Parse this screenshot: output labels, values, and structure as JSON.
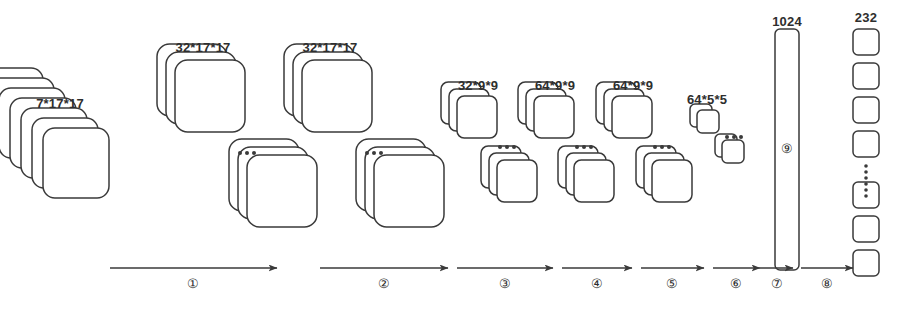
{
  "figure": {
    "type": "neural-network-architecture-diagram",
    "title": "",
    "background_color": "#ffffff",
    "stroke_color": "#3a3a3a",
    "text_color": "#2e2e2e"
  },
  "layers": [
    {
      "id": "input",
      "label": "7*17*17",
      "label_x": 60,
      "label_y": 96,
      "kind": "single-deep-stack",
      "card_w": 66,
      "card_h": 70,
      "count": 7,
      "dx": 11,
      "dy": 10,
      "x": 43,
      "y": 128
    },
    {
      "id": "conv1",
      "label": "32*17*17",
      "label_x": 203,
      "label_y": 40,
      "kind": "split-stack",
      "card_w": 70,
      "card_h": 72,
      "count": 3,
      "dx": 9,
      "dy": 8,
      "top_x": 175,
      "top_y": 60,
      "bottom_x": 247,
      "bottom_y": 155,
      "ellipsis_x": 240,
      "ellipsis_y": 153
    },
    {
      "id": "conv2",
      "label": "32*17*17",
      "label_x": 330,
      "label_y": 40,
      "kind": "split-stack",
      "card_w": 70,
      "card_h": 72,
      "count": 3,
      "dx": 9,
      "dy": 8,
      "top_x": 302,
      "top_y": 60,
      "bottom_x": 374,
      "bottom_y": 155,
      "ellipsis_x": 367,
      "ellipsis_y": 153
    },
    {
      "id": "pool1",
      "label": "32*9*9",
      "label_x": 478,
      "label_y": 78,
      "kind": "split-stack",
      "card_w": 40,
      "card_h": 42,
      "count": 3,
      "dx": 8,
      "dy": 7,
      "top_x": 457,
      "top_y": 96,
      "bottom_x": 497,
      "bottom_y": 160,
      "ellipsis_x": 500,
      "ellipsis_y": 147
    },
    {
      "id": "conv3",
      "label": "64*9*9",
      "label_x": 555,
      "label_y": 78,
      "kind": "split-stack",
      "card_w": 40,
      "card_h": 42,
      "count": 3,
      "dx": 8,
      "dy": 7,
      "top_x": 534,
      "top_y": 96,
      "bottom_x": 574,
      "bottom_y": 160,
      "ellipsis_x": 577,
      "ellipsis_y": 147
    },
    {
      "id": "conv4",
      "label": "64*9*9",
      "label_x": 633,
      "label_y": 78,
      "kind": "split-stack",
      "card_w": 40,
      "card_h": 42,
      "count": 3,
      "dx": 8,
      "dy": 7,
      "top_x": 612,
      "top_y": 96,
      "bottom_x": 652,
      "bottom_y": 160,
      "ellipsis_x": 655,
      "ellipsis_y": 147
    },
    {
      "id": "pool2",
      "label": "64*5*5",
      "label_x": 707,
      "label_y": 92,
      "kind": "split-stack",
      "card_w": 22,
      "card_h": 23,
      "count": 2,
      "dx": 7,
      "dy": 6,
      "top_x": 697,
      "top_y": 110,
      "bottom_x": 722,
      "bottom_y": 140,
      "ellipsis_x": 727,
      "ellipsis_y": 137
    }
  ],
  "fc_layer": {
    "id": "fc",
    "label": "1024",
    "label_x": 787,
    "label_y": 14,
    "x": 775,
    "y": 29,
    "w": 24,
    "h": 241,
    "marker": "⑨",
    "marker_x": 787,
    "marker_y": 148
  },
  "output_layer": {
    "id": "output",
    "label": "232",
    "label_x": 866,
    "label_y": 10,
    "x": 853,
    "cell_w": 26,
    "cell_h": 26,
    "gap": 8,
    "top_cells_y": [
      29,
      63,
      97,
      131
    ],
    "bottom_cells_y": [
      182,
      216,
      250
    ],
    "ellipsis_x": 866,
    "ellipsis_y_start": 166,
    "ellipsis_y_end": 176,
    "ellipsis_dots": 6
  },
  "arrows": [
    {
      "num": "①",
      "x1": 110,
      "x2": 277,
      "y": 268,
      "num_x": 193,
      "num_y": 277
    },
    {
      "num": "②",
      "x1": 320,
      "x2": 448,
      "y": 268,
      "num_x": 384,
      "num_y": 277
    },
    {
      "num": "③",
      "x1": 457,
      "x2": 553,
      "y": 268,
      "num_x": 505,
      "num_y": 277
    },
    {
      "num": "④",
      "x1": 562,
      "x2": 632,
      "y": 268,
      "num_x": 597,
      "num_y": 277
    },
    {
      "num": "⑤",
      "x1": 641,
      "x2": 704,
      "y": 268,
      "num_x": 672,
      "num_y": 277
    },
    {
      "num": "⑥",
      "x1": 713,
      "x2": 760,
      "y": 268,
      "num_x": 736,
      "num_y": 277
    },
    {
      "num": "⑦",
      "x1": 760,
      "x2": 793,
      "y": 268,
      "num_x": 777,
      "num_y": 277
    },
    {
      "num": "⑧",
      "x1": 801,
      "x2": 853,
      "y": 268,
      "num_x": 827,
      "num_y": 277
    }
  ],
  "chart_data": {
    "type": "diagram",
    "layer_dimensions": [
      "7*17*17",
      "32*17*17",
      "32*17*17",
      "32*9*9",
      "64*9*9",
      "64*9*9",
      "64*5*5",
      "1024",
      "232"
    ],
    "operation_steps": [
      "①",
      "②",
      "③",
      "④",
      "⑤",
      "⑥",
      "⑦",
      "⑧",
      "⑨"
    ],
    "input_channels": 7,
    "input_spatial": "17x17",
    "fc_units": 1024,
    "output_units": 232
  }
}
